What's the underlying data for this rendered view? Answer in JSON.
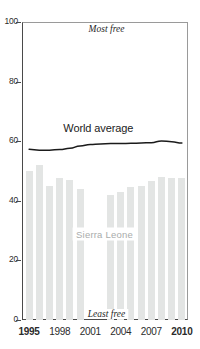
{
  "chart_data": {
    "type": "bar",
    "title": "",
    "subtitle": "",
    "xlabel": "",
    "ylabel": "",
    "ylim": [
      0,
      100
    ],
    "xlim": [
      1994.4,
      2010.6
    ],
    "grid": false,
    "legend_position": "inline-annotations",
    "y_ticks": [
      0,
      20,
      40,
      60,
      80,
      100
    ],
    "y_tick_labels": [
      "0",
      "20",
      "40",
      "60",
      "80",
      "100"
    ],
    "x_ticks": [
      1995,
      1998,
      2001,
      2004,
      2007,
      2010
    ],
    "x_tick_labels": [
      "1995",
      "1998",
      "2001",
      "2004",
      "2007",
      "2010"
    ],
    "x_tick_bold": [
      true,
      false,
      false,
      false,
      false,
      true
    ],
    "categories": [
      1995,
      1996,
      1997,
      1998,
      1999,
      2000,
      2001,
      2002,
      2003,
      2004,
      2005,
      2006,
      2007,
      2008,
      2009,
      2010
    ],
    "series": [
      {
        "name": "Sierra Leone",
        "type": "bar",
        "color": "#e3e5e4",
        "values": [
          50,
          52,
          45,
          47.5,
          47,
          44,
          null,
          null,
          42,
          43,
          44.5,
          45,
          46.5,
          48,
          47.5,
          47.5
        ]
      },
      {
        "name": "World average",
        "type": "line",
        "color": "#1b1b1b",
        "values": [
          57.3,
          57,
          57,
          57.2,
          57.6,
          58.4,
          58.9,
          59.1,
          59.2,
          59.2,
          59.3,
          59.4,
          59.5,
          60.1,
          59.8,
          59.4
        ]
      }
    ],
    "annotations": [
      {
        "text": "Most free",
        "x": 2002.6,
        "y": 97.5,
        "style": "italic"
      },
      {
        "text": "Least free",
        "x": 2002.6,
        "y": 2.0,
        "style": "italic"
      },
      {
        "text": "World average",
        "x": 2001.8,
        "y": 64.5,
        "style": "plain"
      },
      {
        "text": "Sierra Leone",
        "x": 2002.4,
        "y": 29.0,
        "style": "series-label"
      }
    ]
  },
  "labels": {
    "most_free": "Most free",
    "least_free": "Least free",
    "world_average": "World average",
    "sierra_leone": "Sierra Leone"
  },
  "colors": {
    "bar": "#e3e5e4",
    "line": "#1b1b1b",
    "axis": "#4a4a4a",
    "frame": "#9a9a9a",
    "text": "#2b2b2b",
    "series_label": "#a9acab",
    "background": "#ffffff"
  }
}
